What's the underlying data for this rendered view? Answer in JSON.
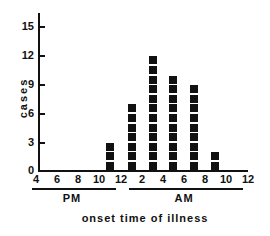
{
  "chart_data": {
    "type": "bar",
    "style": "stacked-squares histogram (one square per case)",
    "title": "",
    "xlabel": "onset time of illness",
    "ylabel": "cases",
    "ylim": [
      0,
      16
    ],
    "yticks": [
      0,
      3,
      6,
      9,
      12,
      15
    ],
    "xtick_labels": [
      "4",
      "6",
      "8",
      "10",
      "12",
      "2",
      "4",
      "6",
      "8",
      "10",
      "12"
    ],
    "period_labels": [
      {
        "label": "PM",
        "span": "4-12"
      },
      {
        "label": "AM",
        "span": "12-12"
      }
    ],
    "categories": [
      "11 PM",
      "1 AM",
      "3 AM",
      "5 AM",
      "7 AM",
      "9 AM"
    ],
    "values": [
      3,
      7,
      12,
      10,
      9,
      2
    ],
    "grid": false,
    "legend": null
  },
  "axis": {
    "ylabel": "cases",
    "xlabel": "onset time of illness",
    "yticks": [
      "0",
      "3",
      "6",
      "9",
      "12",
      "15"
    ],
    "xticks": [
      "4",
      "6",
      "8",
      "10",
      "12",
      "2",
      "4",
      "6",
      "8",
      "10",
      "12"
    ],
    "pm_label": "PM",
    "am_label": "AM"
  },
  "colors": {
    "ink": "#111111",
    "background": "#ffffff"
  }
}
